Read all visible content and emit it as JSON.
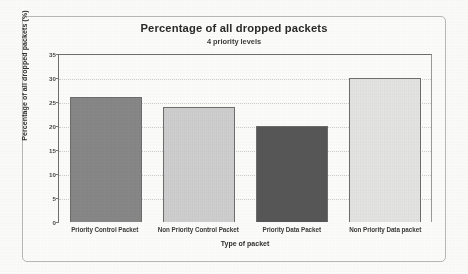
{
  "chart_data": {
    "type": "bar",
    "title": "Percentage of all dropped packets",
    "subtitle": "4 priority levels",
    "xlabel": "Type of packet",
    "ylabel": "Percentage of all dropped packets (%)",
    "categories": [
      "Priority Control Packet",
      "Non Priority Control Packet",
      "Priority Data Packet",
      "Non Priority Data packet"
    ],
    "values": [
      26,
      24,
      20,
      30
    ],
    "ylim": [
      0,
      35
    ],
    "yticks": [
      0,
      5,
      10,
      15,
      20,
      25,
      30,
      35
    ],
    "ytick_labels": [
      "0",
      "5",
      "10",
      "15",
      "20",
      "25",
      "30",
      "35"
    ],
    "grid": true,
    "legend": "none",
    "bar_colors": [
      "#8c8c8c",
      "#d6d6d6",
      "#5a5a5a",
      "#ececea"
    ],
    "bar_edge_color": "#6d6d6d"
  },
  "figure": {
    "background_color": "#fbfbfa",
    "frame_color": "#b9b8b4",
    "axis_color": "#6f6f6f"
  }
}
